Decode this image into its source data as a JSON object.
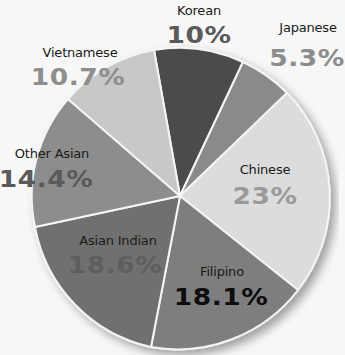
{
  "chart_data": {
    "type": "pie",
    "title": "",
    "center": [
      180,
      196
    ],
    "radius": 150,
    "slices": [
      {
        "label": "Korean",
        "value": 10,
        "display": "10%",
        "color": "#4b4b4b",
        "pct_color": "#5a5a5a",
        "start": [
          154,
          50
        ],
        "end": [
          243,
          62
        ]
      },
      {
        "label": "Japanese",
        "value": 5.3,
        "display": "5.3%",
        "color": "#8a8a8a",
        "pct_color": "#8c8c8c",
        "start": [
          243,
          62
        ],
        "end": [
          287,
          93
        ]
      },
      {
        "label": "Chinese",
        "value": 23,
        "display": "23%",
        "color": "#dcdcdc",
        "pct_color": "#9a9a9a",
        "start": [
          287,
          93
        ],
        "end": [
          298,
          290
        ]
      },
      {
        "label": "Filipino",
        "value": 18.1,
        "display": "18.1%",
        "color": "#7e7e7e",
        "pct_color": "#0d0d0d",
        "start": [
          298,
          290
        ],
        "end": [
          151,
          347
        ]
      },
      {
        "label": "Asian Indian",
        "value": 18.6,
        "display": "18.6%",
        "color": "#6f6f6f",
        "pct_color": "#5e5e5e",
        "start": [
          151,
          347
        ],
        "end": [
          35,
          227
        ]
      },
      {
        "label": "Other Asian",
        "value": 14.4,
        "display": "14.4%",
        "color": "#8d8d8d",
        "pct_color": "#5a5a5a",
        "start": [
          35,
          227
        ],
        "end": [
          68,
          99
        ]
      },
      {
        "label": "Vietnamese",
        "value": 10.7,
        "display": "10.7%",
        "color": "#c8c8c8",
        "pct_color": "#8e8e8e",
        "start": [
          68,
          99
        ],
        "end": [
          154,
          50
        ]
      }
    ],
    "legend": "none",
    "labels_position": "inside/around slices"
  },
  "labels": [
    {
      "name": "Korean",
      "pct": "10%",
      "cx": 199,
      "cy": 3,
      "px": 199,
      "py": 22
    },
    {
      "name": "Japanese",
      "pct": "5.3%",
      "cx": 308,
      "cy": 20,
      "px": 307,
      "py": 45
    },
    {
      "name": "Chinese",
      "pct": "23%",
      "cx": 265,
      "cy": 162,
      "px": 265,
      "py": 183
    },
    {
      "name": "Filipino",
      "pct": "18.1%",
      "cx": 222,
      "cy": 264,
      "px": 221,
      "py": 284
    },
    {
      "name": "Asian Indian",
      "pct": "18.6%",
      "cx": 118,
      "cy": 233,
      "px": 115,
      "py": 252
    },
    {
      "name": "Other Asian",
      "pct": "14.4%",
      "cx": 52,
      "cy": 146,
      "px": 46,
      "py": 166
    },
    {
      "name": "Vietnamese",
      "pct": "10.7%",
      "cx": 80,
      "cy": 45,
      "px": 78,
      "py": 64
    }
  ]
}
